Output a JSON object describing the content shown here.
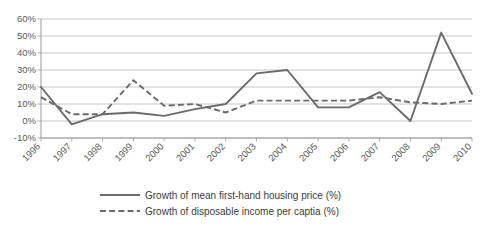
{
  "chart_data": {
    "type": "line",
    "title": "",
    "subtitle": "",
    "xlabel": "",
    "ylabel": "",
    "categories": [
      "1996",
      "1997",
      "1998",
      "1999",
      "2000",
      "2001",
      "2002",
      "2003",
      "2004",
      "2005",
      "2006",
      "2007",
      "2008",
      "2009",
      "2010"
    ],
    "ytick_labels": [
      "60%",
      "50%",
      "40%",
      "30%",
      "20%",
      "10%",
      "0%",
      "-10%"
    ],
    "ytick_values": [
      60,
      50,
      40,
      30,
      20,
      10,
      0,
      -10
    ],
    "ylim": [
      -10,
      60
    ],
    "ytick_step": 10,
    "grid": true,
    "grid_axis": "y",
    "legend_position": "bottom-center",
    "series": [
      {
        "name": "Growth of mean first-hand housing price (%)",
        "style": "solid",
        "color": "#6b6b6b",
        "values": [
          20,
          -2,
          4,
          5,
          3,
          7,
          10,
          28,
          30,
          8,
          8,
          17,
          0,
          52,
          16
        ]
      },
      {
        "name": "Growth of disposable income per captia (%)",
        "style": "dashed",
        "color": "#6b6b6b",
        "values": [
          14,
          4,
          4,
          24,
          9,
          10,
          5,
          12,
          12,
          12,
          12,
          14,
          11,
          10,
          12
        ]
      }
    ]
  },
  "legend": {
    "items": [
      {
        "label": "Growth of mean first-hand housing price (%)",
        "style": "solid"
      },
      {
        "label": "Growth of disposable income per captia (%)",
        "style": "dashed"
      }
    ]
  },
  "colors": {
    "series_line": "#6b6b6b",
    "gridline": "#b8b8b8",
    "axis": "#9a9a9a",
    "text": "#5a5a5a",
    "background": "#ffffff"
  }
}
